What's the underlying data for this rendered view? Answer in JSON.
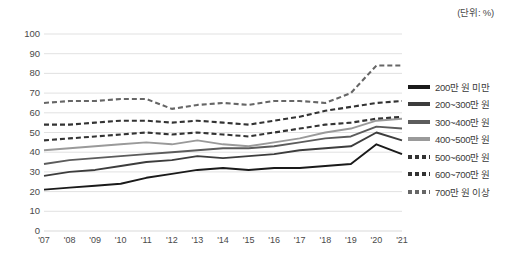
{
  "unit_note": "(단위: %)",
  "chart_data": {
    "type": "line",
    "title": "",
    "subtitle": "",
    "xlabel": "",
    "ylabel": "",
    "unit": "(단위: %)",
    "ylim": [
      0,
      100
    ],
    "yticks": [
      0,
      10,
      20,
      30,
      40,
      50,
      60,
      70,
      80,
      90,
      100
    ],
    "grid": true,
    "legend_position": "right",
    "categories": [
      "'07",
      "'08",
      "'09",
      "'10",
      "'11",
      "'12",
      "'13",
      "'14",
      "'15",
      "'16",
      "'17",
      "'18",
      "'19",
      "'20",
      "'21"
    ],
    "series": [
      {
        "name": "200만 원 미만",
        "style": "solid",
        "color": "#1a1a1a",
        "values": [
          21,
          22,
          23,
          24,
          27,
          29,
          31,
          32,
          31,
          32,
          32,
          33,
          34,
          44,
          39
        ]
      },
      {
        "name": "200~300만 원",
        "style": "solid",
        "color": "#3d3d3d",
        "values": [
          28,
          30,
          31,
          33,
          35,
          36,
          38,
          37,
          38,
          39,
          41,
          42,
          43,
          50,
          46
        ]
      },
      {
        "name": "300~400만 원",
        "style": "solid",
        "color": "#5c5c5c",
        "values": [
          34,
          36,
          37,
          38,
          39,
          40,
          41,
          42,
          42,
          43,
          45,
          47,
          48,
          53,
          52
        ]
      },
      {
        "name": "400~500만 원",
        "style": "solid",
        "color": "#9a9a9a",
        "values": [
          41,
          42,
          43,
          44,
          45,
          44,
          46,
          44,
          43,
          45,
          47,
          50,
          52,
          56,
          57
        ]
      },
      {
        "name": "500~600만 원",
        "style": "dashed",
        "color": "#333333",
        "values": [
          46,
          47,
          48,
          49,
          50,
          49,
          50,
          49,
          48,
          50,
          52,
          54,
          55,
          57,
          58
        ]
      },
      {
        "name": "600~700만 원",
        "style": "dashed",
        "color": "#333333",
        "values": [
          54,
          54,
          55,
          56,
          56,
          55,
          56,
          55,
          54,
          56,
          58,
          61,
          63,
          65,
          66
        ]
      },
      {
        "name": "700만 원 이상",
        "style": "dashed",
        "color": "#666666",
        "values": [
          65,
          66,
          66,
          67,
          67,
          62,
          64,
          65,
          64,
          66,
          66,
          65,
          70,
          84,
          84
        ]
      }
    ]
  }
}
